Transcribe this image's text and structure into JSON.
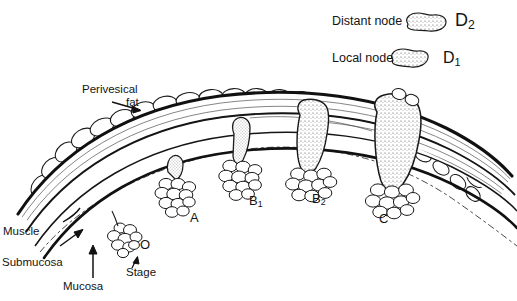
{
  "figure": {
    "type": "medical-illustration",
    "background_color": "#ffffff",
    "ink_color": "#141414"
  },
  "legend": {
    "rows": [
      {
        "label": "Distant node",
        "symbol": "lymph-node-shape",
        "code": "D",
        "code_sub": "2"
      },
      {
        "label": "Local node",
        "symbol": "lymph-node-shape",
        "code": "D",
        "code_sub": "1"
      }
    ]
  },
  "anatomy_labels": [
    {
      "id": "perivesical-fat",
      "line1": "Perivesical",
      "line2": "fat"
    },
    {
      "id": "muscle",
      "text": "Muscle"
    },
    {
      "id": "submucosa",
      "text": "Submucosa"
    },
    {
      "id": "mucosa",
      "text": "Mucosa"
    }
  ],
  "stage_caption": {
    "text": "Stage",
    "marker": "O"
  },
  "stage_labels": [
    {
      "id": "stage-A",
      "text": "A",
      "sub": ""
    },
    {
      "id": "stage-B1",
      "text": "B",
      "sub": "1"
    },
    {
      "id": "stage-B2",
      "text": "B",
      "sub": "2"
    },
    {
      "id": "stage-C",
      "text": "C",
      "sub": ""
    }
  ]
}
